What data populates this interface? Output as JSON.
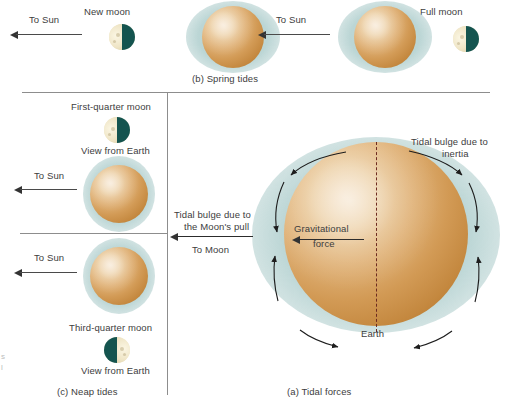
{
  "figure": {
    "captions": {
      "spring": "(b) Spring tides",
      "neap": "(c) Neap tides",
      "tidal": "(a) Tidal forces"
    }
  },
  "panel_b": {
    "caption": "(b) Spring tides",
    "left": {
      "to_sun": "To Sun",
      "moon_label": "New moon",
      "moon_phase": "new-moon"
    },
    "right": {
      "to_sun": "To Sun",
      "moon_label": "Full moon",
      "moon_phase": "full-moon"
    }
  },
  "panel_c": {
    "caption": "(c) Neap tides",
    "top": {
      "moon_label": "First-quarter moon",
      "view_label": "View from Earth",
      "to_sun": "To Sun",
      "moon_phase": "first-quarter"
    },
    "bottom": {
      "to_sun": "To Sun",
      "moon_label": "Third-quarter moon",
      "view_label": "View from Earth",
      "moon_phase": "third-quarter"
    }
  },
  "panel_a": {
    "caption": "(a) Tidal forces",
    "labels": {
      "bulge_inertia": "Tidal bulge due to inertia",
      "bulge_inertia_line1": "Tidal bulge due to",
      "bulge_inertia_line2": "inertia",
      "bulge_moon_line1": "Tidal bulge due to",
      "bulge_moon_line2": "the Moon's pull",
      "to_moon": "To Moon",
      "gravitational_line1": "Gravitational",
      "gravitational_line2": "force",
      "earth": "Earth"
    }
  },
  "colors": {
    "earth_highlight": "#f3ddc0",
    "earth_mid": "#d29a55",
    "earth_dark": "#a76b28",
    "tidal_bulge": "#9ec4c3",
    "moon_dark": "#14544f",
    "moon_lit": "#f2ead0",
    "axis": "#6d2b20",
    "rule": "#8d8d8d",
    "text": "#3d3d3d"
  },
  "edge_fragments": {
    "frag1": "s",
    "frag2": "l"
  }
}
